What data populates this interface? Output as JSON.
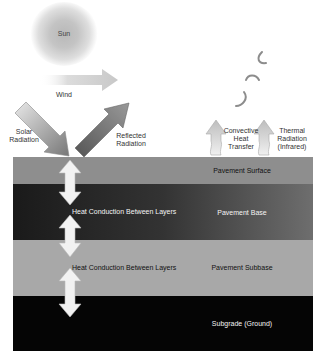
{
  "sun": {
    "label": "Sun"
  },
  "wind": {
    "label": "Wind"
  },
  "radiation": {
    "solar": [
      "Solar",
      "Radiation"
    ],
    "reflected": [
      "Reflected",
      "Radiation"
    ],
    "convective": [
      "Convective",
      "Heat",
      "Transfer"
    ],
    "thermal": [
      "Thermal",
      "Radiation",
      "(Infrared)"
    ]
  },
  "layers": [
    {
      "name": "Pavement Surface",
      "color": "#8e8e8e"
    },
    {
      "name": "Pavement Base",
      "color_start": "#1c1c1c",
      "color_end": "#6a6a6a"
    },
    {
      "name": "Pavement Subbase",
      "color": "#a9a9a9"
    },
    {
      "name": "Subgrade (Ground)",
      "color": "#050505"
    }
  ],
  "conduction": [
    {
      "label": "Heat Conduction Between Layers"
    },
    {
      "label": "Heat Conduction Between Layers"
    }
  ]
}
